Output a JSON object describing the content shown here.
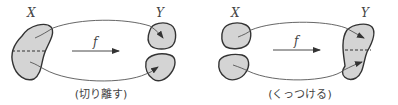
{
  "diagram": {
    "panels": [
      {
        "id": "cut",
        "domain_label": "X",
        "codomain_label": "Y",
        "map_label": "f",
        "caption": "(切り離す)",
        "description": "One set X split by a dashed line maps to two separate pieces in Y"
      },
      {
        "id": "glue",
        "domain_label": "X",
        "codomain_label": "Y",
        "map_label": "f",
        "caption": "(くっつける)",
        "description": "Two separate pieces in X map to one set Y joined along a dashed line"
      }
    ],
    "colors": {
      "fill": "#d4d4d4",
      "stroke": "#333333",
      "line": "#555555",
      "text": "#444444"
    }
  }
}
